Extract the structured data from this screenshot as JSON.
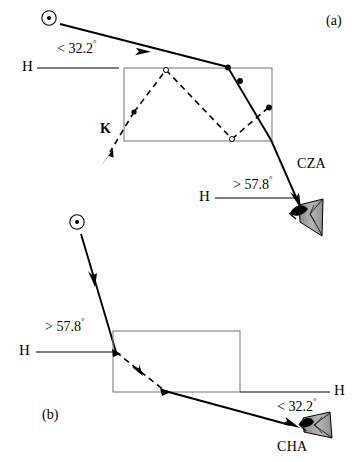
{
  "figure": {
    "width": 361,
    "height": 462,
    "background_color": "#ffffff",
    "ink_color": "#000000",
    "crystal_outline_color": "#808080",
    "eye_shading_color": "#a0a0a0"
  },
  "panels": [
    {
      "id": "a",
      "tag": "(a)",
      "arc_name": "CZA",
      "entry_angle_label": "< 32.2",
      "entry_degree_symbol": "°",
      "exit_angle_label": "> 57.8",
      "exit_degree_symbol": "°",
      "horizon_label_left": "H",
      "horizon_label_right": "H",
      "crystal_label": "K",
      "sun_symbol": "sun-symbol",
      "observer_symbol": "eye-icon",
      "description": "Sunlight enters the top face of a plate crystal at less than 32.2 degrees above the horizon, refracts through the crystal and exits a side face toward the observer at more than 57.8 degrees."
    },
    {
      "id": "b",
      "tag": "(b)",
      "arc_name": "CHA",
      "entry_angle_label": "> 57.8",
      "entry_degree_symbol": "°",
      "exit_angle_label": "< 32.2",
      "exit_degree_symbol": "°",
      "horizon_label_left": "H",
      "horizon_label_right": "H",
      "sun_symbol": "sun-symbol",
      "observer_symbol": "eye-icon",
      "description": "Sunlight enters a side face of a plate crystal at more than 57.8 degrees above the horizon, refracts through the crystal and exits the bottom face toward the observer at less than 32.2 degrees."
    }
  ],
  "legend_terms": {
    "H": "Horizon line",
    "K": "Ice crystal",
    "CZA": "Circumzenithal arc",
    "CHA": "Circumhorizontal arc"
  }
}
